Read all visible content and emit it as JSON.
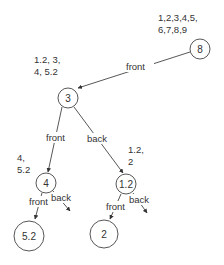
{
  "diagram": {
    "type": "binary-space-partition-tree",
    "nodes": [
      {
        "id": "n8",
        "label": "8",
        "cx": 200,
        "cy": 49,
        "r": 10,
        "set": [
          "1,2,3,4,5,",
          "6,7,8,9"
        ],
        "set_x": 158,
        "set_y": [
          21,
          33
        ]
      },
      {
        "id": "n3",
        "label": "3",
        "cx": 68,
        "cy": 98,
        "r": 10,
        "set": [
          "1.2, 3,",
          "4, 5.2"
        ],
        "set_x": 34,
        "set_y": [
          63,
          75
        ]
      },
      {
        "id": "n4",
        "label": "4",
        "cx": 46,
        "cy": 183,
        "r": 10,
        "set": [
          "4,",
          "5.2"
        ],
        "set_x": 17,
        "set_y": [
          161,
          173
        ]
      },
      {
        "id": "n12",
        "label": "1.2",
        "cx": 126,
        "cy": 184,
        "r": 10,
        "set": [
          "1.2,",
          "2"
        ],
        "set_x": 128,
        "set_y": [
          153,
          165
        ]
      },
      {
        "id": "n52",
        "label": "5.2",
        "cx": 29,
        "cy": 236,
        "r": 15,
        "set": [],
        "set_x": 0,
        "set_y": []
      },
      {
        "id": "n2",
        "label": "2",
        "cx": 104,
        "cy": 234,
        "r": 14,
        "set": [],
        "set_x": 0,
        "set_y": []
      }
    ],
    "edges": [
      {
        "from": "n8",
        "to": "n3",
        "label": "front",
        "x1": 190,
        "y1": 52,
        "x2": 78,
        "y2": 88,
        "lx": 126,
        "ly": 70
      },
      {
        "from": "n3",
        "to": "n4",
        "label": "front",
        "x1": 62,
        "y1": 107,
        "x2": 48,
        "y2": 172,
        "lx": 46,
        "ly": 141
      },
      {
        "from": "n3",
        "to": "n12",
        "label": "back",
        "x1": 74,
        "y1": 107,
        "x2": 123,
        "y2": 173,
        "lx": 87,
        "ly": 142
      },
      {
        "from": "n4",
        "to": "n52",
        "label": "front",
        "x1": 42,
        "y1": 193,
        "x2": 35,
        "y2": 219,
        "lx": 29,
        "ly": 205
      },
      {
        "from": "n4",
        "to": null,
        "label": "back",
        "x1": 53,
        "y1": 191,
        "x2": 70,
        "y2": 211,
        "lx": 51,
        "ly": 201
      },
      {
        "from": "n12",
        "to": "n2",
        "label": "front",
        "x1": 121,
        "y1": 194,
        "x2": 110,
        "y2": 219,
        "lx": 106,
        "ly": 210
      },
      {
        "from": "n12",
        "to": null,
        "label": "back",
        "x1": 133,
        "y1": 193,
        "x2": 147,
        "y2": 213,
        "lx": 129,
        "ly": 203
      }
    ]
  },
  "colors": {
    "stroke": "#444444",
    "text": "#333333",
    "background": "#ffffff"
  }
}
